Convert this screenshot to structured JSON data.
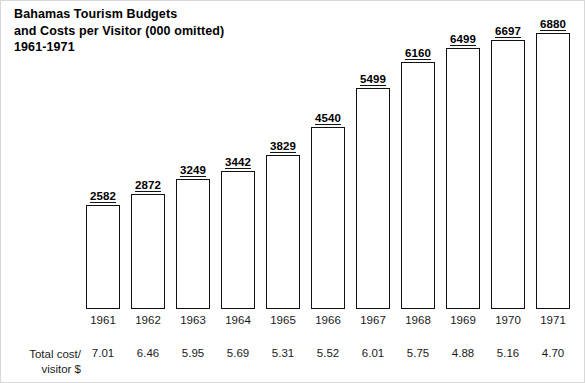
{
  "title": {
    "line1": "Bahamas Tourism Budgets",
    "line2": "and Costs per Visitor (000 omitted)",
    "line3": "1961-1971"
  },
  "row_label": {
    "line1": "Total cost/",
    "line2": "visitor $"
  },
  "colors": {
    "bar_outline": "#111111",
    "bar_fill": "#ffffff",
    "text": "#000000",
    "background": "#ffffff"
  },
  "chart_data": {
    "type": "bar",
    "title": "Bahamas Tourism Budgets and Costs per Visitor (000 omitted) 1961-1971",
    "xlabel": "",
    "ylabel": "",
    "grid": false,
    "legend": "none",
    "ylim": [
      0,
      6880
    ],
    "categories": [
      "1961",
      "1962",
      "1963",
      "1964",
      "1965",
      "1966",
      "1967",
      "1968",
      "1969",
      "1970",
      "1971"
    ],
    "values": [
      2582,
      2872,
      3249,
      3442,
      3829,
      4540,
      5499,
      6160,
      6499,
      6697,
      6880
    ],
    "data_labels": [
      "2582",
      "2872",
      "3249",
      "3442",
      "3829",
      "4540",
      "5499",
      "6160",
      "6499",
      "6697",
      "6880"
    ],
    "series": [
      {
        "name": "Tourism Budget (000 omitted)",
        "values": [
          2582,
          2872,
          3249,
          3442,
          3829,
          4540,
          5499,
          6160,
          6499,
          6697,
          6880
        ]
      },
      {
        "name": "Total cost/visitor $",
        "values": [
          7.01,
          6.46,
          5.95,
          5.69,
          5.31,
          5.52,
          6.01,
          5.75,
          4.88,
          5.16,
          4.7
        ]
      }
    ],
    "cost_labels": [
      "7.01",
      "6.46",
      "5.95",
      "5.69",
      "5.31",
      "5.52",
      "6.01",
      "5.75",
      "4.88",
      "5.16",
      "4.70"
    ]
  }
}
